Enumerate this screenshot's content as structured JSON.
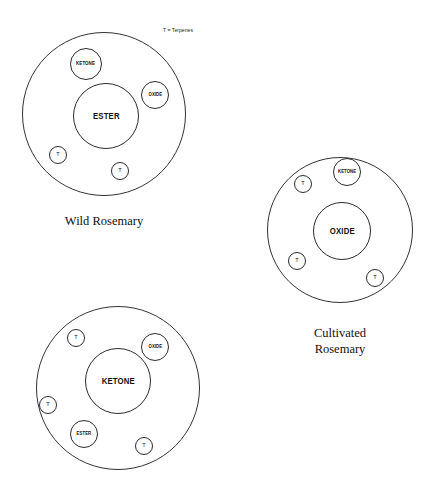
{
  "figure": {
    "background_color": "#ffffff",
    "stroke_color": "#2b2b2b",
    "legend": {
      "text": "T = Terpenes",
      "x": 163,
      "y": 27
    }
  },
  "groups": [
    {
      "id": "wild-rosemary",
      "caption": "Wild Rosemary",
      "caption_x": 104,
      "caption_y": 213,
      "caption_width": 150,
      "outer": {
        "cx": 104,
        "cy": 114,
        "r": 82
      },
      "components": [
        {
          "name": "ester",
          "label": "ESTER",
          "cx": 106,
          "cy": 116,
          "r": 33,
          "size": "core"
        },
        {
          "name": "ketone",
          "label": "KETONE",
          "cx": 86,
          "cy": 64,
          "r": 16,
          "size": "medium"
        },
        {
          "name": "oxide",
          "label": "OXIDE",
          "cx": 155,
          "cy": 95,
          "r": 14,
          "size": "tiny"
        },
        {
          "name": "terpene-1",
          "label": "T",
          "cx": 58,
          "cy": 155,
          "r": 9,
          "size": "t"
        },
        {
          "name": "terpene-2",
          "label": "T",
          "cx": 120,
          "cy": 171,
          "r": 9,
          "size": "t"
        }
      ]
    },
    {
      "id": "cultivated-rosemary",
      "caption": "Cultivated\nRosemary",
      "caption_x": 340,
      "caption_y": 325,
      "caption_width": 150,
      "outer": {
        "cx": 340,
        "cy": 230,
        "r": 73
      },
      "components": [
        {
          "name": "oxide",
          "label": "OXIDE",
          "cx": 342,
          "cy": 231,
          "r": 29,
          "size": "core"
        },
        {
          "name": "ketone",
          "label": "KETONE",
          "cx": 347,
          "cy": 172,
          "r": 14,
          "size": "tiny"
        },
        {
          "name": "terpene-1",
          "label": "T",
          "cx": 303,
          "cy": 184,
          "r": 9,
          "size": "t"
        },
        {
          "name": "terpene-2",
          "label": "T",
          "cx": 297,
          "cy": 261,
          "r": 9,
          "size": "t"
        },
        {
          "name": "terpene-3",
          "label": "T",
          "cx": 375,
          "cy": 278,
          "r": 9,
          "size": "t"
        }
      ]
    },
    {
      "id": "ketone-chemotype",
      "caption": "",
      "caption_x": 118,
      "caption_y": 478,
      "caption_width": 150,
      "outer": {
        "cx": 118,
        "cy": 388,
        "r": 82
      },
      "components": [
        {
          "name": "ketone",
          "label": "KETONE",
          "cx": 118,
          "cy": 381,
          "r": 33,
          "size": "core"
        },
        {
          "name": "oxide",
          "label": "OXIDE",
          "cx": 155,
          "cy": 347,
          "r": 14,
          "size": "tiny"
        },
        {
          "name": "ester",
          "label": "ESTER",
          "cx": 84,
          "cy": 434,
          "r": 14,
          "size": "tiny"
        },
        {
          "name": "terpene-1",
          "label": "T",
          "cx": 76,
          "cy": 338,
          "r": 9,
          "size": "t"
        },
        {
          "name": "terpene-2",
          "label": "T",
          "cx": 48,
          "cy": 405,
          "r": 9,
          "size": "t"
        },
        {
          "name": "terpene-3",
          "label": "T",
          "cx": 144,
          "cy": 446,
          "r": 9,
          "size": "t"
        }
      ]
    }
  ]
}
